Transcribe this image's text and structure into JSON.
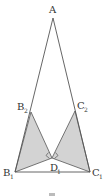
{
  "figure": {
    "labels": {
      "A": "A",
      "B2": "B",
      "B2_sub": "2",
      "C2": "C",
      "C2_sub": "2",
      "D1": "D",
      "D1_sub": "1",
      "B1": "B",
      "B1_sub": "1",
      "C1": "C",
      "C1_sub": "1",
      "caption": "⌐"
    },
    "points": {
      "A": [
        53,
        18
      ],
      "B2": [
        31,
        112
      ],
      "C2": [
        75,
        111
      ],
      "D1": [
        52,
        158
      ],
      "B1": [
        15,
        172
      ],
      "C1": [
        90,
        172
      ]
    },
    "shaded_regions": [
      "B2-B1-D1",
      "C2-C1-D1"
    ],
    "right_angles_at": "D1",
    "colors": {
      "line": "#555555",
      "fill": "#d3d3d3",
      "background": "#ffffff"
    }
  }
}
